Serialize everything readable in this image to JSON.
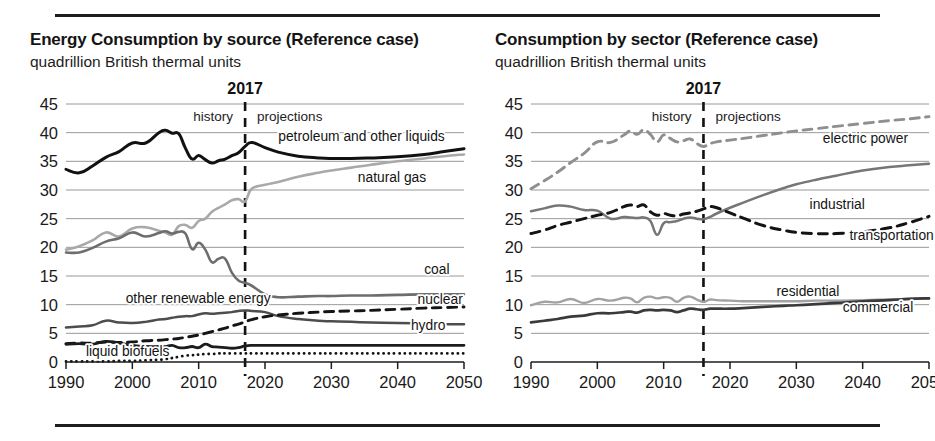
{
  "figure": {
    "panels": [
      {
        "id": "energy-by-source",
        "title": "Energy Consumption by source (Reference case)",
        "subtitle": "quadrillion British thermal units"
      },
      {
        "id": "consumption-by-sector",
        "title": "Consumption by sector (Reference case)",
        "subtitle": "quadrillion British thermal units"
      }
    ]
  },
  "chart_data": [
    {
      "type": "line",
      "id": "energy-by-source",
      "title": "Energy Consumption by source (Reference case)",
      "subtitle": "quadrillion British thermal units",
      "xlabel": "",
      "ylabel": "quadrillion British thermal units",
      "xlim": [
        1990,
        2050
      ],
      "ylim": [
        0,
        45
      ],
      "xticks": [
        1990,
        2000,
        2010,
        2020,
        2030,
        2040,
        2050
      ],
      "yticks": [
        0,
        5,
        10,
        15,
        20,
        25,
        30,
        35,
        40,
        45
      ],
      "grid": true,
      "legend_position": "inline-right",
      "annotations": {
        "divider_year": 2017,
        "divider_label": "2017",
        "history_label": "history",
        "projections_label": "projections"
      },
      "x": [
        1990,
        1992,
        1994,
        1996,
        1998,
        2000,
        2002,
        2004,
        2005,
        2006,
        2007,
        2008,
        2009,
        2010,
        2011,
        2012,
        2013,
        2014,
        2015,
        2016,
        2017,
        2018,
        2020,
        2022,
        2025,
        2028,
        2030,
        2033,
        2036,
        2040,
        2044,
        2047,
        2050
      ],
      "series": [
        {
          "name": "petroleum and other liquids",
          "style": "solid",
          "color": "#111111",
          "width": 3.0,
          "label_x": 2022,
          "label_y": 38.6,
          "values": [
            33.6,
            33.0,
            34.2,
            35.7,
            36.7,
            38.2,
            38.2,
            40.0,
            40.4,
            39.9,
            39.8,
            37.3,
            35.4,
            36.0,
            35.3,
            34.7,
            35.1,
            35.4,
            36.0,
            36.5,
            37.6,
            38.3,
            37.4,
            36.6,
            35.9,
            35.6,
            35.5,
            35.5,
            35.6,
            35.8,
            36.2,
            36.7,
            37.2
          ]
        },
        {
          "name": "natural gas",
          "style": "solid",
          "color": "#a9a9a9",
          "width": 2.6,
          "label_x": 2034,
          "label_y": 31.4,
          "values": [
            19.6,
            20.2,
            21.2,
            22.6,
            21.9,
            23.3,
            23.5,
            22.9,
            22.6,
            22.2,
            23.7,
            23.9,
            23.4,
            24.6,
            25.0,
            26.2,
            26.9,
            27.5,
            28.2,
            28.4,
            28.0,
            30.2,
            30.9,
            31.4,
            32.3,
            33.0,
            33.4,
            33.9,
            34.4,
            35.0,
            35.5,
            35.9,
            36.2
          ]
        },
        {
          "name": "coal",
          "style": "solid",
          "color": "#6d6d6d",
          "width": 2.6,
          "label_x": 2044,
          "label_y": 15.4,
          "values": [
            19.1,
            19.1,
            19.9,
            21.0,
            21.6,
            22.6,
            21.9,
            22.5,
            22.8,
            22.4,
            22.7,
            22.4,
            19.7,
            20.8,
            19.6,
            17.4,
            18.0,
            18.0,
            15.6,
            14.2,
            13.8,
            13.3,
            11.8,
            11.3,
            11.4,
            11.5,
            11.5,
            11.6,
            11.6,
            11.7,
            11.8,
            11.8,
            11.8
          ]
        },
        {
          "name": "other renewable energy",
          "style": "solid",
          "color": "#4d4d4d",
          "width": 2.5,
          "label_x": 1999,
          "label_y": 10.3,
          "values": [
            6.0,
            6.2,
            6.4,
            7.2,
            6.9,
            6.8,
            7.0,
            7.4,
            7.5,
            7.7,
            7.9,
            8.0,
            8.0,
            8.3,
            8.5,
            8.4,
            8.5,
            8.6,
            8.7,
            8.9,
            9.0,
            8.9,
            8.7,
            8.0,
            7.5,
            7.2,
            7.1,
            7.0,
            6.9,
            6.8,
            6.7,
            6.6,
            6.6
          ]
        },
        {
          "name": "nuclear",
          "style": "dashed",
          "color": "#151515",
          "width": 2.9,
          "label_x": 2043,
          "label_y": 10.1,
          "values": [
            3.2,
            3.3,
            3.3,
            3.5,
            3.4,
            3.5,
            3.7,
            3.8,
            3.9,
            4.0,
            4.1,
            4.3,
            4.5,
            4.7,
            5.0,
            5.3,
            5.6,
            5.9,
            6.3,
            6.6,
            7.0,
            7.4,
            7.9,
            8.2,
            8.5,
            8.7,
            8.8,
            8.9,
            9.0,
            9.2,
            9.4,
            9.5,
            9.6
          ]
        },
        {
          "name": "hydro",
          "style": "solid",
          "color": "#1c1c1c",
          "width": 2.8,
          "label_x": 2042,
          "label_y": 5.6,
          "values": [
            3.1,
            3.2,
            3.1,
            3.6,
            3.3,
            2.9,
            2.7,
            2.7,
            2.7,
            2.9,
            2.5,
            2.5,
            2.7,
            2.5,
            3.1,
            2.7,
            2.6,
            2.5,
            2.4,
            2.5,
            2.8,
            2.9,
            2.9,
            2.9,
            2.9,
            2.9,
            2.9,
            2.9,
            2.9,
            2.9,
            2.9,
            2.9,
            2.9
          ]
        },
        {
          "name": "liquid biofuels",
          "style": "dotted",
          "color": "#141414",
          "width": 2.8,
          "label_x": 1993,
          "label_y": 1.1,
          "values": [
            0.1,
            0.1,
            0.1,
            0.1,
            0.2,
            0.2,
            0.3,
            0.4,
            0.5,
            0.7,
            0.9,
            1.1,
            1.2,
            1.3,
            1.4,
            1.4,
            1.5,
            1.5,
            1.5,
            1.5,
            1.5,
            1.5,
            1.5,
            1.5,
            1.5,
            1.5,
            1.5,
            1.5,
            1.5,
            1.5,
            1.5,
            1.5,
            1.5
          ]
        }
      ]
    },
    {
      "type": "line",
      "id": "consumption-by-sector",
      "title": "Consumption by sector (Reference case)",
      "subtitle": "quadrillion British thermal units",
      "xlabel": "",
      "ylabel": "quadrillion British thermal units",
      "xlim": [
        1990,
        2050
      ],
      "ylim": [
        0,
        45
      ],
      "xticks": [
        1990,
        2000,
        2010,
        2020,
        2030,
        2040,
        2050
      ],
      "yticks": [
        0,
        5,
        10,
        15,
        20,
        25,
        30,
        35,
        40,
        45
      ],
      "grid": true,
      "legend_position": "inline-right",
      "annotations": {
        "divider_year": 2016,
        "divider_label": "2017",
        "history_label": "history",
        "projections_label": "projections"
      },
      "x": [
        1990,
        1992,
        1994,
        1996,
        1998,
        2000,
        2002,
        2004,
        2005,
        2006,
        2007,
        2008,
        2009,
        2010,
        2011,
        2012,
        2013,
        2014,
        2015,
        2016,
        2017,
        2018,
        2020,
        2022,
        2025,
        2028,
        2030,
        2033,
        2036,
        2040,
        2044,
        2047,
        2050
      ],
      "series": [
        {
          "name": "electric power",
          "style": "dashed",
          "color": "#8f8f8f",
          "width": 2.9,
          "label_x": 2034,
          "label_y": 38.2,
          "values": [
            30.2,
            31.6,
            33.1,
            34.8,
            36.4,
            38.4,
            38.3,
            39.6,
            40.3,
            39.7,
            40.5,
            39.7,
            38.4,
            39.6,
            39.0,
            38.4,
            38.6,
            38.9,
            38.1,
            37.6,
            38.1,
            38.4,
            38.7,
            39.0,
            39.5,
            40.0,
            40.3,
            40.7,
            41.1,
            41.6,
            42.1,
            42.4,
            42.8
          ]
        },
        {
          "name": "industrial",
          "style": "solid",
          "color": "#767676",
          "width": 2.5,
          "label_x": 2032,
          "label_y": 26.7,
          "values": [
            26.3,
            26.8,
            27.3,
            27.1,
            26.5,
            26.4,
            25.0,
            25.3,
            25.2,
            25.1,
            25.2,
            24.6,
            22.2,
            24.2,
            24.4,
            24.6,
            25.0,
            25.2,
            25.0,
            24.9,
            25.3,
            25.9,
            26.9,
            27.8,
            29.1,
            30.3,
            31.0,
            31.8,
            32.5,
            33.4,
            34.0,
            34.3,
            34.6
          ]
        },
        {
          "name": "transportation",
          "style": "dashed",
          "color": "#131313",
          "width": 3.0,
          "label_x": 2038,
          "label_y": 21.2,
          "values": [
            22.4,
            23.0,
            23.8,
            24.4,
            25.0,
            25.6,
            26.1,
            27.1,
            27.4,
            27.1,
            27.4,
            26.2,
            25.6,
            25.9,
            25.6,
            25.5,
            25.8,
            26.0,
            26.3,
            26.7,
            27.1,
            26.9,
            26.0,
            25.1,
            23.8,
            23.0,
            22.6,
            22.4,
            22.4,
            22.7,
            23.4,
            24.3,
            25.4
          ]
        },
        {
          "name": "residential",
          "style": "solid",
          "color": "#a2a2a2",
          "width": 2.4,
          "label_x": 2027,
          "label_y": 11.5,
          "values": [
            9.9,
            10.5,
            10.4,
            11.0,
            10.3,
            11.0,
            10.7,
            11.2,
            11.1,
            10.4,
            11.2,
            11.4,
            11.1,
            11.3,
            11.2,
            10.5,
            11.2,
            11.4,
            10.9,
            10.5,
            10.9,
            10.8,
            10.7,
            10.6,
            10.6,
            10.6,
            10.6,
            10.7,
            10.7,
            10.8,
            10.9,
            11.0,
            11.1
          ]
        },
        {
          "name": "commercial",
          "style": "solid",
          "color": "#3a3a3a",
          "width": 2.7,
          "label_x": 2037,
          "label_y": 8.7,
          "values": [
            6.9,
            7.2,
            7.5,
            7.9,
            8.1,
            8.5,
            8.5,
            8.7,
            8.8,
            8.6,
            9.0,
            9.1,
            9.0,
            9.1,
            9.0,
            8.7,
            9.0,
            9.3,
            9.2,
            9.1,
            9.3,
            9.3,
            9.3,
            9.4,
            9.6,
            9.8,
            9.9,
            10.1,
            10.3,
            10.6,
            10.8,
            11.0,
            11.1
          ]
        }
      ]
    }
  ]
}
